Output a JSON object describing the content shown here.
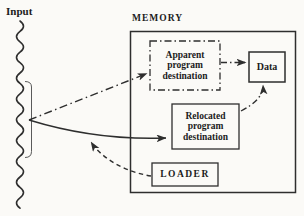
{
  "colors": {
    "paper": "#fbfaf7",
    "ink": "#2e2e2e"
  },
  "labels": {
    "input": "Input",
    "memory": "MEMORY"
  },
  "boxes": {
    "apparent": {
      "line1": "Apparent",
      "line2": "program",
      "line3": "destination",
      "border": "dash-dot"
    },
    "relocated": {
      "line1": "Relocated",
      "line2": "program",
      "line3": "destination",
      "border": "solid"
    },
    "data": {
      "label": "Data",
      "border": "solid"
    },
    "loader": {
      "label": "LOADER",
      "border": "solid"
    }
  },
  "arrows": [
    {
      "from": "input-stream",
      "to": "apparent-program-destination",
      "style": "dash-dot"
    },
    {
      "from": "apparent-program-destination",
      "to": "data",
      "style": "dash-dot"
    },
    {
      "from": "relocated-program-destination",
      "to": "data",
      "style": "dash-dot"
    },
    {
      "from": "input-stream",
      "to": "relocated-program-destination",
      "style": "solid"
    },
    {
      "from": "loader",
      "to": "input-stream",
      "style": "dashed"
    }
  ]
}
